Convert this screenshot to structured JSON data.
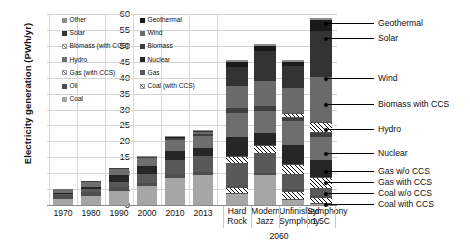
{
  "chart_data": {
    "type": "bar",
    "title": "",
    "xlabel": "",
    "ylabel": "Electricity generation (PWh/yr)",
    "ylim": [
      0,
      60
    ],
    "ytick_step": 5,
    "yticks": [
      0,
      5,
      10,
      15,
      20,
      25,
      30,
      35,
      40,
      45,
      50,
      55,
      60
    ],
    "stacked": true,
    "grid": true,
    "legend_position": "inside-top-left",
    "categories": [
      "1970",
      "1980",
      "1990",
      "2000",
      "2010",
      "2013",
      "Hard Rock",
      "Modern Jazz",
      "Unfinished Symphony",
      "Symphony 1.5C"
    ],
    "group_labels": [
      {
        "label": "2060",
        "covers": [
          "Hard Rock",
          "Modern Jazz",
          "Unfinished Symphony",
          "Symphony 1.5C"
        ]
      }
    ],
    "series": [
      {
        "name": "Coal",
        "color": "#a6a6a6",
        "hatch": false,
        "values": [
          2.0,
          2.7,
          4.4,
          6.0,
          8.6,
          9.4,
          4.0,
          9.5,
          2.2,
          1.0
        ]
      },
      {
        "name": "Coal (with CCS)",
        "color": "#ffffff",
        "hatch": true,
        "values": [
          0,
          0,
          0,
          0,
          0,
          0,
          1.5,
          0,
          2.3,
          1.6
        ]
      },
      {
        "name": "Oil",
        "color": "#4d4d4d",
        "hatch": false,
        "values": [
          1.1,
          1.3,
          1.2,
          1.0,
          1.0,
          1.0,
          0.5,
          0.5,
          0.4,
          0.3
        ]
      },
      {
        "name": "Gas",
        "color": "#595959",
        "hatch": false,
        "values": [
          0.6,
          1.0,
          1.7,
          2.6,
          4.5,
          5.0,
          7.5,
          6.5,
          5.0,
          2.6
        ]
      },
      {
        "name": "Gas (with CCS)",
        "color": "#ffffff",
        "hatch": true,
        "values": [
          0,
          0,
          0,
          0,
          0,
          0,
          2.0,
          2.5,
          3.0,
          3.4
        ]
      },
      {
        "name": "Nuclear",
        "color": "#262626",
        "hatch": false,
        "values": [
          0.1,
          0.7,
          2.0,
          2.6,
          2.8,
          2.5,
          6.0,
          3.5,
          6.0,
          5.2
        ]
      },
      {
        "name": "Hydro",
        "color": "#6e6e6e",
        "hatch": false,
        "values": [
          1.2,
          1.8,
          2.2,
          2.7,
          3.5,
          3.9,
          7.5,
          7.0,
          7.5,
          7.4
        ]
      },
      {
        "name": "Biomass",
        "color": "#3f3f3f",
        "hatch": false,
        "values": [
          0,
          0.1,
          0.2,
          0.3,
          0.5,
          0.6,
          1.5,
          1.5,
          1.6,
          1.6
        ]
      },
      {
        "name": "Biomass (with CCS)",
        "color": "#ffffff",
        "hatch": true,
        "values": [
          0,
          0,
          0,
          0,
          0,
          0,
          0,
          0,
          0.8,
          3.0
        ]
      },
      {
        "name": "Wind",
        "color": "#6b6b6b",
        "hatch": false,
        "values": [
          0,
          0,
          0,
          0.1,
          0.4,
          0.7,
          7.0,
          8.0,
          8.0,
          14.0
        ]
      },
      {
        "name": "Solar",
        "color": "#333333",
        "hatch": false,
        "values": [
          0,
          0,
          0,
          0,
          0.1,
          0.3,
          6.0,
          9.5,
          7.0,
          14.5
        ]
      },
      {
        "name": "Geothermal",
        "color": "#1a1a1a",
        "hatch": false,
        "values": [
          0,
          0,
          0,
          0.1,
          0.1,
          0.1,
          1.5,
          1.5,
          1.2,
          3.4
        ]
      },
      {
        "name": "Other",
        "color": "#8c8c8c",
        "hatch": false,
        "values": [
          0,
          0,
          0,
          0.1,
          0.1,
          0.1,
          0.5,
          0.5,
          0.5,
          0.6
        ]
      }
    ],
    "totals": [
      5.0,
      7.6,
      11.7,
      15.5,
      22.1,
      23.6,
      45.5,
      50.5,
      45.5,
      58.6
    ],
    "annotations": [
      {
        "label": "Geothermal",
        "target_series": "Geothermal"
      },
      {
        "label": "Solar",
        "target_series": "Solar"
      },
      {
        "label": "Wind",
        "target_series": "Wind"
      },
      {
        "label": "Biomass with CCS",
        "target_series": "Biomass (with CCS)"
      },
      {
        "label": "Hydro",
        "target_series": "Hydro"
      },
      {
        "label": "Nuclear",
        "target_series": "Nuclear"
      },
      {
        "label": "Gas w/o CCS",
        "target_series": "Gas"
      },
      {
        "label": "Gas with  CCS",
        "target_series": "Gas (with CCS)"
      },
      {
        "label": "Coal w/o CCS",
        "target_series": "Coal"
      },
      {
        "label": "Coal with  CCS",
        "target_series": "Coal (with CCS)"
      }
    ]
  },
  "legend": {
    "items": [
      {
        "label": "Other",
        "swatch": "#8c8c8c",
        "hatch": false
      },
      {
        "label": "Geothermal",
        "swatch": "#1a1a1a",
        "hatch": false
      },
      {
        "label": "Solar",
        "swatch": "#333333",
        "hatch": false
      },
      {
        "label": "Wind",
        "swatch": "#6b6b6b",
        "hatch": false
      },
      {
        "label": "Biomass (with CCS)",
        "swatch": "#ffffff",
        "hatch": true
      },
      {
        "label": "Biomass",
        "swatch": "#3f3f3f",
        "hatch": false
      },
      {
        "label": "Hydro",
        "swatch": "#6e6e6e",
        "hatch": false
      },
      {
        "label": "Nuclear",
        "swatch": "#262626",
        "hatch": false
      },
      {
        "label": "Gas (with CCS)",
        "swatch": "#ffffff",
        "hatch": true
      },
      {
        "label": "Gas",
        "swatch": "#595959",
        "hatch": false
      },
      {
        "label": "Oil",
        "swatch": "#4d4d4d",
        "hatch": false
      },
      {
        "label": "Coal (with CCS)",
        "swatch": "#ffffff",
        "hatch": true
      },
      {
        "label": "Coal",
        "swatch": "#a6a6a6",
        "hatch": false
      }
    ]
  }
}
